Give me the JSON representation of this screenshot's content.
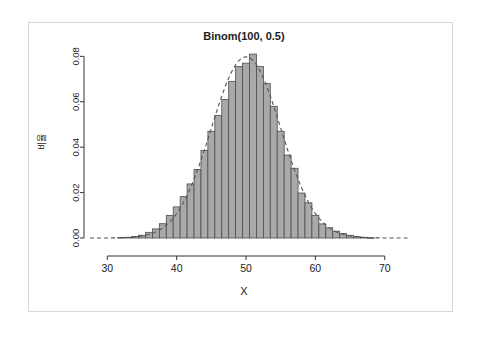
{
  "figure": {
    "title": "Binom(100, 0.5)",
    "x_axis_label": "X",
    "y_axis_label": "비율"
  },
  "chart_data": {
    "type": "bar",
    "title": "Binom(100, 0.5)",
    "subtitle": "",
    "xlabel": "X",
    "ylabel": "비율",
    "xlim": [
      27.5,
      73.5
    ],
    "ylim": [
      0.0,
      0.085
    ],
    "xticks": [
      30,
      40,
      50,
      60,
      70
    ],
    "yticks": [
      0.0,
      0.02,
      0.04,
      0.06,
      0.08
    ],
    "ytick_labels": [
      "0.00",
      "0.02",
      "0.04",
      "0.06",
      "0.08"
    ],
    "xtick_labels": [
      "30",
      "40",
      "50",
      "60",
      "70"
    ],
    "grid": false,
    "legend": null,
    "bar_fill_color": "#a9a9a9",
    "bar_edge_color": "#4d4d4d",
    "curve_color": "#555555",
    "curve_style": "dashed",
    "curve_label": "normal approximation",
    "bar_width": 1,
    "categories": [
      30,
      31,
      32,
      33,
      34,
      35,
      36,
      37,
      38,
      39,
      40,
      41,
      42,
      43,
      44,
      45,
      46,
      47,
      48,
      49,
      50,
      51,
      52,
      53,
      54,
      55,
      56,
      57,
      58,
      59,
      60,
      61,
      62,
      63,
      64,
      65,
      66,
      67,
      68,
      69,
      70
    ],
    "values": [
      0.0,
      0.0,
      0.0,
      0.0001,
      0.0001,
      0.0002,
      0.0006,
      0.0012,
      0.0022,
      0.0037,
      0.006,
      0.0093,
      0.014,
      0.0199,
      0.0273,
      0.0355,
      0.044,
      0.0521,
      0.0587,
      0.0629,
      0.064,
      0.0629,
      0.0587,
      0.0521,
      0.044,
      0.0355,
      0.0273,
      0.0199,
      0.014,
      0.0093,
      0.006,
      0.0037,
      0.0022,
      0.0012,
      0.0006,
      0.0002,
      0.0001,
      0.0001,
      0.0,
      0.0,
      0.0
    ],
    "series": [
      {
        "name": "Binomial pmf (simulated relative frequency)",
        "type": "bar",
        "x": [
          30,
          31,
          32,
          33,
          34,
          35,
          36,
          37,
          38,
          39,
          40,
          41,
          42,
          43,
          44,
          45,
          46,
          47,
          48,
          49,
          50,
          51,
          52,
          53,
          54,
          55,
          56,
          57,
          58,
          59,
          60,
          61,
          62,
          63,
          64,
          65,
          66,
          67,
          68,
          69,
          70
        ],
        "values": [
          0.0,
          0.0,
          0.0002,
          0.0003,
          0.0007,
          0.0012,
          0.0025,
          0.004,
          0.0063,
          0.0099,
          0.0137,
          0.0182,
          0.0238,
          0.0302,
          0.0386,
          0.047,
          0.054,
          0.061,
          0.069,
          0.0755,
          0.077,
          0.081,
          0.0755,
          0.068,
          0.058,
          0.047,
          0.0365,
          0.0307,
          0.0198,
          0.0155,
          0.01,
          0.0062,
          0.0045,
          0.003,
          0.002,
          0.0012,
          0.0006,
          0.0003,
          0.0001,
          0.0,
          0.0
        ]
      },
      {
        "name": "Normal(50, 5) density curve",
        "type": "line",
        "style": "dashed",
        "mean": 50,
        "sd": 5,
        "peak": 0.0798
      }
    ]
  }
}
